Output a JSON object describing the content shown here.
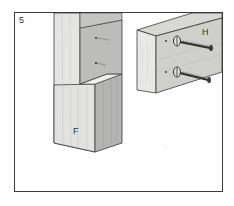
{
  "figure": {
    "step_number": "5",
    "labels": {
      "post": "F",
      "rail": "H"
    },
    "colors": {
      "frame": "#3a3a3a",
      "wood_light": "#e4e4e0",
      "wood_mid": "#c8c8c4",
      "wood_dark": "#a8a8a4",
      "screw": "#2e2e2e"
    },
    "parts": [
      {
        "id": "F",
        "description": "notched post"
      },
      {
        "id": "H",
        "description": "rail board with two screws"
      }
    ],
    "screw_count": 2,
    "pilot_holes_in_notch": 2
  }
}
